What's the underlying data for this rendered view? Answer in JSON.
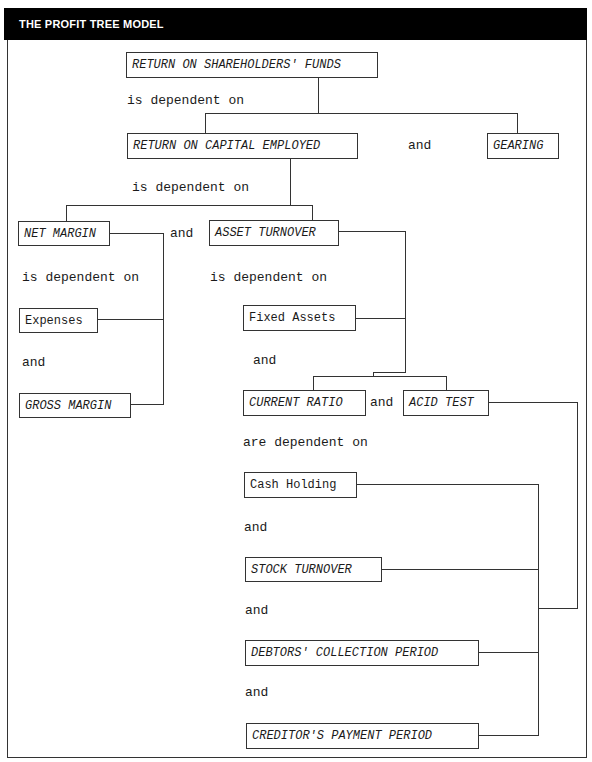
{
  "header": {
    "title": "THE PROFIT TREE MODEL"
  },
  "nodes": {
    "rosf": "RETURN ON SHAREHOLDERS' FUNDS",
    "roce": "RETURN ON CAPITAL EMPLOYED",
    "gearing": "GEARING",
    "net_margin": "NET MARGIN",
    "asset_turnover": "ASSET TURNOVER",
    "expenses": "Expenses",
    "gross_margin": "GROSS MARGIN",
    "fixed_assets": "Fixed Assets",
    "current_ratio": "CURRENT RATIO",
    "acid_test": "ACID TEST",
    "cash_holding": "Cash Holding",
    "stock_turnover": "STOCK TURNOVER",
    "debtors_collection": "DEBTORS' COLLECTION PERIOD",
    "creditors_payment": "CREDITOR'S PAYMENT PERIOD"
  },
  "labels": {
    "dep_rosf": "is dependent on",
    "and_roce_gearing": "and",
    "dep_roce": "is dependent on",
    "and_nm_at": "and",
    "dep_nm": "is dependent on",
    "dep_at": "is dependent on",
    "and_exp_gm": "and",
    "and_fa_cr": "and",
    "and_cr_at": "and",
    "dep_cr_at": "are dependent on",
    "and_cash_stock": "and",
    "and_stock_debtors": "and",
    "and_debtors_creditors": "and"
  }
}
